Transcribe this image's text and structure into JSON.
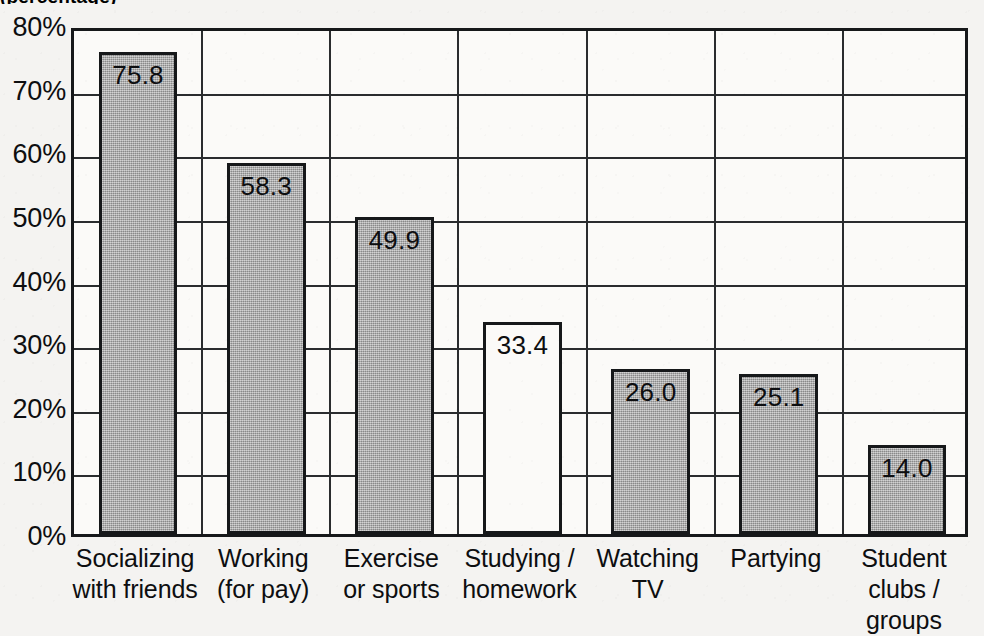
{
  "figure": {
    "cropped_title_fragment": "(percentage)",
    "background_color": "#f4f3f1",
    "axis_color": "#16181a",
    "bar_fill_color": "#a9a9a9",
    "bar_hollow_color": "#ffffff"
  },
  "chart_data": {
    "type": "bar",
    "title": "",
    "xlabel": "",
    "ylabel": "",
    "ylim": [
      0,
      80
    ],
    "ytick_labels": [
      "80%",
      "70%",
      "60%",
      "50%",
      "40%",
      "30%",
      "20%",
      "10%",
      "0%"
    ],
    "ytick_values": [
      80,
      70,
      60,
      50,
      40,
      30,
      20,
      10,
      0
    ],
    "grid": "horizontal-and-vertical",
    "legend": "none",
    "categories": [
      "Socializing with friends",
      "Working (for pay)",
      "Exercise or sports",
      "Studying / homework",
      "Watching TV",
      "Partying",
      "Student clubs / groups"
    ],
    "category_lines": [
      [
        "Socializing",
        "with friends"
      ],
      [
        "Working",
        "(for pay)"
      ],
      [
        "Exercise",
        "or sports"
      ],
      [
        "Studying /",
        "homework"
      ],
      [
        "Watching",
        "TV"
      ],
      [
        "Partying",
        ""
      ],
      [
        "Student",
        "clubs / groups"
      ]
    ],
    "values": [
      75.8,
      58.3,
      49.9,
      33.4,
      26.0,
      25.1,
      14.0
    ],
    "value_labels": [
      "75.8",
      "58.3",
      "49.9",
      "33.4",
      "26.0",
      "25.1",
      "14.0"
    ],
    "bar_styles": [
      "filled",
      "filled",
      "filled",
      "hollow",
      "filled",
      "filled",
      "filled"
    ]
  }
}
